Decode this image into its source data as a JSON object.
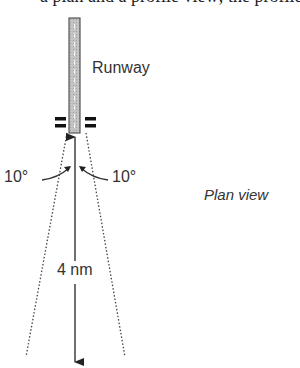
{
  "figure": {
    "cut_off_top_text": "a plan and a profile view; the profile view",
    "runway_label": "Runway",
    "left_angle_label": "10°",
    "right_angle_label": "10°",
    "view_label": "Plan view",
    "distance_label": "4 nm",
    "colors": {
      "runway_fill": "#b8b8b8",
      "runway_border": "#555555",
      "line": "#333333",
      "text": "#333333"
    }
  }
}
